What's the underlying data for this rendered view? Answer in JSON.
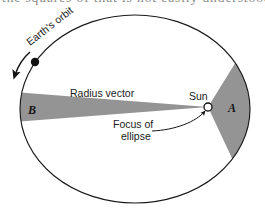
{
  "figure": {
    "clipped_line_above": "the squares of that is not easily understood",
    "labels": {
      "orbit": "Earth's orbit",
      "radius_vector": "Radius vector",
      "sun": "Sun",
      "focus_line1": "Focus of",
      "focus_line2": "ellipse",
      "sector_a": "A",
      "sector_b": "B"
    },
    "icons": {
      "earth": "earth-dot-icon",
      "sun": "sun-circle-icon",
      "direction": "orbit-direction-arrow-icon",
      "leader": "focus-leader-line-icon"
    },
    "colors": {
      "sector_fill": "#949494",
      "orbit_stroke": "#1a1a1a",
      "text": "#1b1b1b",
      "background": "#ffffff",
      "sun_fill": "#ffffff"
    },
    "geometry": {
      "ellipse_cx": 135,
      "ellipse_cy": 109,
      "ellipse_rx": 115,
      "ellipse_ry": 94,
      "sun_x": 208,
      "sun_y": 107,
      "sun_r": 4,
      "earth_x": 35,
      "earth_y": 62,
      "earth_r": 4
    }
  }
}
